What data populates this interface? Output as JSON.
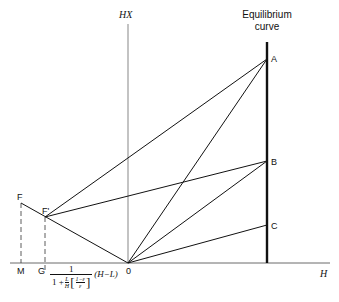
{
  "diagram": {
    "type": "ponchon-savarit-style construction",
    "axes": {
      "vertical_label": "HX",
      "horizontal_label": "H",
      "origin_label": "0"
    },
    "equilibrium_curve": {
      "label_line1": "Equilibrium",
      "label_line2": "curve"
    },
    "points": {
      "A": "A",
      "B": "B",
      "C": "C",
      "F": "F",
      "F_prime": "F'",
      "M": "M",
      "G": "G",
      "O": "0"
    },
    "formula": {
      "numerator": "1",
      "one_plus": "1 +",
      "L_over_H_num": "L",
      "L_over_H_den": "H",
      "bracket_num": "1−ε",
      "bracket_den": "ε",
      "suffix": "(H−L)"
    },
    "lines": [
      {
        "from": "F",
        "to": "O"
      },
      {
        "from": "F'",
        "to": "A"
      },
      {
        "from": "F'",
        "to": "B"
      },
      {
        "from": "O",
        "to": "A"
      },
      {
        "from": "O",
        "to": "B"
      },
      {
        "from": "O",
        "to": "C"
      },
      {
        "from": "F",
        "to": "M",
        "style": "dashed"
      },
      {
        "from": "F'",
        "to": "G",
        "style": "dashed"
      }
    ]
  }
}
